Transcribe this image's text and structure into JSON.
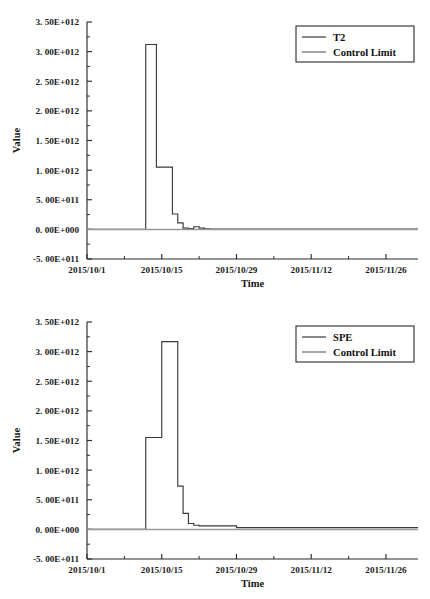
{
  "figure": {
    "name": "t2-spe-control-charts",
    "background_color": "#ffffff",
    "series_color": "#3a3a3a",
    "limit_color": "#9a9a9a",
    "axis_color": "#2b2b2b",
    "caption_partial": ""
  },
  "chart_data": [
    {
      "type": "line",
      "name": "t2-control-chart",
      "title": "",
      "xlabel": "Time",
      "ylabel": "Value",
      "grid": false,
      "legend_position": "top-right",
      "xlim": [
        "2015/10/1",
        "2015/12/2"
      ],
      "ylim": [
        -500000000000.0,
        3500000000000.0
      ],
      "ytick_labels": [
        "3. 50E+012",
        "3. 00E+012",
        "2. 50E+012",
        "2. 00E+012",
        "1. 50E+012",
        "1. 00E+012",
        "5. 00E+011",
        "0. 00E+000",
        "-5. 00E+011"
      ],
      "ytick_values": [
        3500000000000.0,
        3000000000000.0,
        2500000000000.0,
        2000000000000.0,
        1500000000000.0,
        1000000000000.0,
        500000000000.0,
        0.0,
        -500000000000.0
      ],
      "xtick_labels": [
        "2015/10/1",
        "2015/10/15",
        "2015/10/29",
        "2015/11/12",
        "2015/11/26"
      ],
      "xtick_days": [
        0,
        14,
        28,
        42,
        56
      ],
      "xminor_days": [
        7,
        21,
        35,
        49
      ],
      "series": [
        {
          "name": "T2",
          "legend_label": "T2",
          "style": "step",
          "x_days": [
            0,
            11,
            11,
            13,
            13,
            16,
            16,
            17,
            17,
            18,
            18,
            19,
            19,
            20,
            20,
            21,
            21,
            22,
            22,
            23,
            23,
            62
          ],
          "values": [
            0,
            0,
            3120000000000.0,
            3120000000000.0,
            1050000000000.0,
            1050000000000.0,
            260000000000.0,
            260000000000.0,
            110000000000.0,
            110000000000.0,
            20000000000.0,
            20000000000.0,
            15000000000.0,
            15000000000.0,
            45000000000.0,
            45000000000.0,
            20000000000.0,
            20000000000.0,
            10000000000.0,
            10000000000.0,
            5000000000.0,
            5000000000.0
          ]
        },
        {
          "name": "Control Limit",
          "legend_label": "Control Limit",
          "style": "constant",
          "value": 0.0
        }
      ]
    },
    {
      "type": "line",
      "name": "spe-control-chart",
      "title": "",
      "xlabel": "Time",
      "ylabel": "Value",
      "grid": false,
      "legend_position": "top-right",
      "xlim": [
        "2015/10/1",
        "2015/12/2"
      ],
      "ylim": [
        -500000000000.0,
        3500000000000.0
      ],
      "ytick_labels": [
        "3. 50E+012",
        "3. 00E+012",
        "2. 50E+012",
        "2. 00E+012",
        "1. 50E+012",
        "1. 00E+012",
        "5. 00E+011",
        "0. 00E+000",
        "-5. 00E+011"
      ],
      "ytick_values": [
        3500000000000.0,
        3000000000000.0,
        2500000000000.0,
        2000000000000.0,
        1500000000000.0,
        1000000000000.0,
        500000000000.0,
        0.0,
        -500000000000.0
      ],
      "xtick_labels": [
        "2015/10/1",
        "2015/10/15",
        "2015/10/29",
        "2015/11/12",
        "2015/11/26"
      ],
      "xtick_days": [
        0,
        14,
        28,
        42,
        56
      ],
      "xminor_days": [
        7,
        21,
        35,
        49
      ],
      "series": [
        {
          "name": "SPE",
          "legend_label": "SPE",
          "style": "step",
          "x_days": [
            0,
            11,
            11,
            14,
            14,
            17,
            17,
            18,
            18,
            19,
            19,
            20,
            20,
            21,
            21,
            28,
            28,
            62
          ],
          "values": [
            0,
            0,
            1550000000000.0,
            1550000000000.0,
            3170000000000.0,
            3170000000000.0,
            730000000000.0,
            730000000000.0,
            270000000000.0,
            270000000000.0,
            100000000000.0,
            100000000000.0,
            70000000000.0,
            70000000000.0,
            60000000000.0,
            60000000000.0,
            30000000000.0,
            30000000000.0
          ]
        },
        {
          "name": "Control Limit",
          "legend_label": "Control Limit",
          "style": "constant",
          "value": 0.0
        }
      ]
    }
  ]
}
